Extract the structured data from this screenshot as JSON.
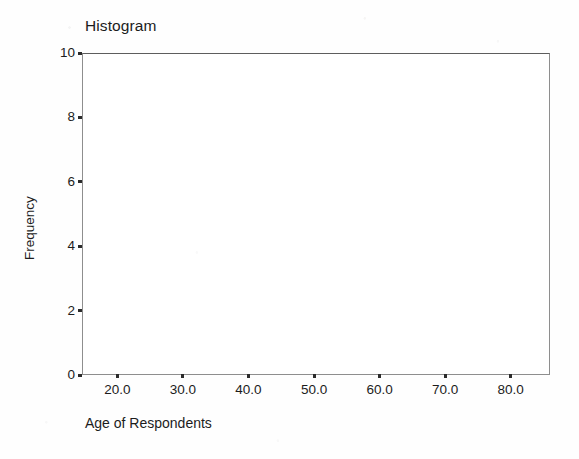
{
  "figure": {
    "title": "Histogram",
    "background_color": "#ffffff",
    "frame_color": "#8e8e8e",
    "text_color": "#1c1c1c"
  },
  "chart_data": {
    "type": "bar",
    "title": "Histogram",
    "xlabel": "Age of Respondents",
    "ylabel": "Frequency",
    "x_tick_labels": [
      "20.0",
      "30.0",
      "40.0",
      "50.0",
      "60.0",
      "70.0",
      "80.0"
    ],
    "x_tick_values": [
      20,
      30,
      40,
      50,
      60,
      70,
      80
    ],
    "y_tick_labels": [
      "0",
      "2",
      "4",
      "6",
      "8",
      "10"
    ],
    "y_tick_values": [
      0,
      2,
      4,
      6,
      8,
      10
    ],
    "xlim": [
      14.6,
      86.0
    ],
    "ylim": [
      0,
      10
    ],
    "grid": false,
    "legend": false,
    "categories": [],
    "values": [],
    "bars": [],
    "note": "Empty histogram axes: frame, ticks and labels only, no plotted bars."
  },
  "axes": {
    "y_ticks": [
      {
        "label": "10",
        "value": 10
      },
      {
        "label": "8",
        "value": 8
      },
      {
        "label": "6",
        "value": 6
      },
      {
        "label": "4",
        "value": 4
      },
      {
        "label": "2",
        "value": 2
      },
      {
        "label": "0",
        "value": 0
      }
    ],
    "x_ticks": [
      {
        "label": "20.0",
        "value": 20
      },
      {
        "label": "30.0",
        "value": 30
      },
      {
        "label": "40.0",
        "value": 40
      },
      {
        "label": "50.0",
        "value": 50
      },
      {
        "label": "60.0",
        "value": 60
      },
      {
        "label": "70.0",
        "value": 70
      },
      {
        "label": "80.0",
        "value": 80
      }
    ],
    "y_title": "Frequency",
    "x_title": "Age of Respondents"
  }
}
